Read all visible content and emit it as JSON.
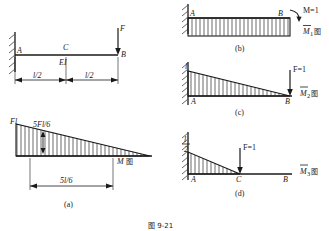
{
  "figure": {
    "caption_bottom": "图 9-21",
    "panels": [
      {
        "id": "a",
        "caption": "(a)",
        "kind": "beam-and-moment-diagram",
        "beam": {
          "left_support_label": "A",
          "mid_point_label": "C",
          "right_end_label": "B",
          "stiffness_label": "EI",
          "load_label": "F",
          "dimension_left": "l/2",
          "dimension_right": "l/2",
          "support_type": "fixed"
        },
        "diagram": {
          "peak_label": "Fl",
          "inner_label": "5Fl/6",
          "span_label": "5l/6",
          "diagram_name": "M",
          "diagram_suffix": "图",
          "shape": "triangle-decreasing"
        }
      },
      {
        "id": "b",
        "caption": "(b)",
        "kind": "unit-moment-diagram",
        "left_support_label": "A",
        "right_end_label": "B",
        "load_label": "M=1",
        "diagram_name": "M",
        "diagram_subscript": "1",
        "diagram_suffix": "图",
        "shape": "uniform-rectangle",
        "support_type": "fixed"
      },
      {
        "id": "c",
        "caption": "(c)",
        "kind": "unit-force-diagram",
        "left_support_label": "A",
        "right_end_label": "B",
        "peak_label": "l",
        "load_label": "F=1",
        "diagram_name": "M",
        "diagram_subscript": "2",
        "diagram_suffix": "图",
        "shape": "triangle-decreasing",
        "support_type": "fixed"
      },
      {
        "id": "d",
        "caption": "(d)",
        "kind": "unit-force-midspan-diagram",
        "left_support_label": "A",
        "mid_point_label": "C",
        "right_end_label": "B",
        "peak_numerator": "l",
        "peak_denominator": "2",
        "load_label": "F=1",
        "diagram_name": "M",
        "diagram_subscript": "3",
        "diagram_suffix": "图",
        "shape": "triangle-half-span",
        "support_type": "fixed"
      }
    ]
  },
  "colors": {
    "line": "#1a1a1a",
    "hatch": "#555555",
    "background": "#ffffff"
  }
}
